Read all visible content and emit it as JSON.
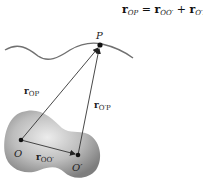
{
  "equation": {
    "lhs_symbol": "r",
    "lhs_sub": "OP",
    "equals": "=",
    "term1_symbol": "r",
    "term1_sub": "OO′",
    "plus": "+",
    "term2_symbol": "r",
    "term2_sub": "O′P"
  },
  "points": {
    "P": {
      "label": "P",
      "x": 100,
      "y": 45
    },
    "O": {
      "label": "O",
      "x": 21,
      "y": 140
    },
    "O_prime": {
      "label": "O′",
      "x": 78,
      "y": 155
    }
  },
  "vectors": [
    {
      "name": "r_OP",
      "label_symbol": "r",
      "label_sub": "OP",
      "from": "O",
      "to": "P"
    },
    {
      "name": "r_O'P",
      "label_symbol": "r",
      "label_sub": "O′P",
      "from": "O′",
      "to": "P"
    },
    {
      "name": "r_OO'",
      "label_symbol": "r",
      "label_sub": "OO′",
      "from": "O",
      "to": "O′"
    }
  ],
  "colors": {
    "curve": "#6b6b6b",
    "blob_light": "#e0e0e0",
    "blob_dark": "#8c8c8c",
    "arrow": "#333333",
    "point": "#111111"
  }
}
